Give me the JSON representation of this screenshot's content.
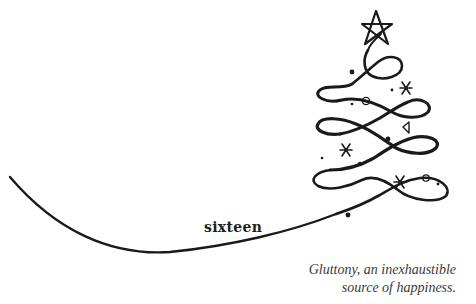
{
  "chapter": {
    "title": "sixteen"
  },
  "epigraph": {
    "lines": [
      "Gluttony, an inexhaustible",
      "source of happiness."
    ]
  },
  "illustration": {
    "subject": "christmas-tree-swirl",
    "elements": [
      "star-icon",
      "swirl-tree-line",
      "sweeping-ground-line",
      "snowflake-icon",
      "circle-ornament-icon",
      "triangle-ornament-icon",
      "dot-ornament-icon"
    ],
    "ink_color": "#1a1a1a"
  }
}
